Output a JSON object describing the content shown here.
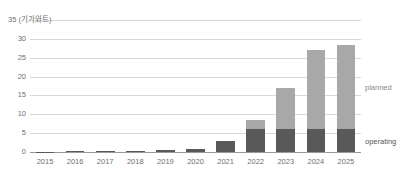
{
  "chart_data": {
    "type": "bar",
    "subtype": "stacked-bar",
    "title": "",
    "unit_label": "35 (기가와트)",
    "unit_note": "기가와트",
    "xlabel": "",
    "ylabel": "",
    "ylim": [
      0,
      35
    ],
    "yticks": [
      0,
      5,
      10,
      15,
      20,
      25,
      30,
      35
    ],
    "ytick_labels": [
      "0",
      "5",
      "10",
      "15",
      "20",
      "25",
      "30",
      "35"
    ],
    "grid": true,
    "legend_position": "right-inline",
    "categories": [
      "2015",
      "2016",
      "2017",
      "2018",
      "2019",
      "2020",
      "2021",
      "2022",
      "2023",
      "2024",
      "2025"
    ],
    "series": [
      {
        "name": "operating",
        "color": "#595959",
        "values": [
          0.05,
          0.15,
          0.3,
          0.35,
          0.5,
          0.9,
          3.0,
          6.0,
          6.0,
          6.0,
          6.0
        ]
      },
      {
        "name": "planned",
        "color": "#a8a8a8",
        "values": [
          0,
          0,
          0,
          0,
          0,
          0,
          0,
          2.5,
          11.0,
          21.0,
          22.5
        ]
      }
    ],
    "totals": [
      0.05,
      0.15,
      0.3,
      0.35,
      0.5,
      0.9,
      3.0,
      8.5,
      17.0,
      27.0,
      28.5
    ]
  },
  "legend": {
    "planned_label": "planned",
    "operating_label": "operating"
  },
  "colors": {
    "operating": "#595959",
    "planned": "#a8a8a8",
    "gridline": "#d9d9d9",
    "axis": "#9a9a9a",
    "text": "#6f6f6f",
    "background": "#ffffff"
  }
}
